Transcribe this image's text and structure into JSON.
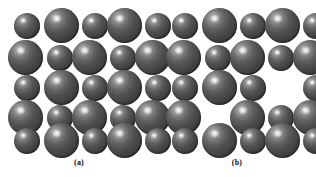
{
  "figure": {
    "background_color": "#ffffff",
    "sphere_color": "#4a4a4a",
    "sphere_highlight_color": "#d8d8d8",
    "sphere_edge_color": "#232323",
    "caption_color": "#111111"
  },
  "panels": [
    {
      "id": "a",
      "caption": "(a)",
      "description": "perfect ionic crystal lattice, 5 by 5 alternating large and small spheres",
      "rows": 5,
      "cols": 5,
      "spheres": [
        {
          "row": 1,
          "col": 1,
          "size": "small",
          "x": 14,
          "y": 13,
          "d": 26
        },
        {
          "row": 1,
          "col": 2,
          "size": "large",
          "x": 44,
          "y": 8,
          "d": 35
        },
        {
          "row": 1,
          "col": 3,
          "size": "small",
          "x": 82,
          "y": 13,
          "d": 26
        },
        {
          "row": 1,
          "col": 4,
          "size": "large",
          "x": 107,
          "y": 8,
          "d": 35
        },
        {
          "row": 1,
          "col": 5,
          "size": "small",
          "x": 145,
          "y": 13,
          "d": 26
        },
        {
          "row": 2,
          "col": 1,
          "size": "large",
          "x": 8,
          "y": 40,
          "d": 35
        },
        {
          "row": 2,
          "col": 2,
          "size": "small",
          "x": 47,
          "y": 45,
          "d": 26
        },
        {
          "row": 2,
          "col": 3,
          "size": "large",
          "x": 72,
          "y": 40,
          "d": 35
        },
        {
          "row": 2,
          "col": 4,
          "size": "small",
          "x": 110,
          "y": 45,
          "d": 26
        },
        {
          "row": 2,
          "col": 5,
          "size": "large",
          "x": 135,
          "y": 40,
          "d": 35
        },
        {
          "row": 3,
          "col": 1,
          "size": "small",
          "x": 14,
          "y": 75,
          "d": 26
        },
        {
          "row": 3,
          "col": 2,
          "size": "large",
          "x": 44,
          "y": 70,
          "d": 35
        },
        {
          "row": 3,
          "col": 3,
          "size": "small",
          "x": 82,
          "y": 75,
          "d": 26
        },
        {
          "row": 3,
          "col": 4,
          "size": "large",
          "x": 107,
          "y": 70,
          "d": 35
        },
        {
          "row": 3,
          "col": 5,
          "size": "small",
          "x": 145,
          "y": 75,
          "d": 26
        },
        {
          "row": 4,
          "col": 1,
          "size": "large",
          "x": 8,
          "y": 100,
          "d": 35
        },
        {
          "row": 4,
          "col": 2,
          "size": "small",
          "x": 47,
          "y": 105,
          "d": 26
        },
        {
          "row": 4,
          "col": 3,
          "size": "large",
          "x": 72,
          "y": 100,
          "d": 35
        },
        {
          "row": 4,
          "col": 4,
          "size": "small",
          "x": 110,
          "y": 105,
          "d": 26
        },
        {
          "row": 4,
          "col": 5,
          "size": "large",
          "x": 135,
          "y": 100,
          "d": 35
        },
        {
          "row": 5,
          "col": 1,
          "size": "small",
          "x": 14,
          "y": 128,
          "d": 26
        },
        {
          "row": 5,
          "col": 2,
          "size": "large",
          "x": 44,
          "y": 123,
          "d": 35
        },
        {
          "row": 5,
          "col": 3,
          "size": "small",
          "x": 82,
          "y": 128,
          "d": 26
        },
        {
          "row": 5,
          "col": 4,
          "size": "large",
          "x": 107,
          "y": 123,
          "d": 35
        },
        {
          "row": 5,
          "col": 5,
          "size": "small",
          "x": 145,
          "y": 128,
          "d": 26
        }
      ]
    },
    {
      "id": "b",
      "caption": "(b)",
      "description": "lattice with Schottky vacancy defects: one large sphere missing at row 3 column 4 and one small sphere missing at row 4 column 2",
      "rows": 5,
      "cols": 5,
      "vacancies": [
        {
          "row": 3,
          "col": 4,
          "size": "large"
        },
        {
          "row": 4,
          "col": 2,
          "size": "small"
        }
      ],
      "spheres": [
        {
          "row": 1,
          "col": 1,
          "size": "small",
          "x": 14,
          "y": 13,
          "d": 26
        },
        {
          "row": 1,
          "col": 2,
          "size": "large",
          "x": 44,
          "y": 8,
          "d": 35
        },
        {
          "row": 1,
          "col": 3,
          "size": "small",
          "x": 82,
          "y": 13,
          "d": 26
        },
        {
          "row": 1,
          "col": 4,
          "size": "large",
          "x": 107,
          "y": 8,
          "d": 35
        },
        {
          "row": 1,
          "col": 5,
          "size": "small",
          "x": 145,
          "y": 13,
          "d": 26
        },
        {
          "row": 2,
          "col": 1,
          "size": "large",
          "x": 8,
          "y": 40,
          "d": 35
        },
        {
          "row": 2,
          "col": 2,
          "size": "small",
          "x": 47,
          "y": 45,
          "d": 26
        },
        {
          "row": 2,
          "col": 3,
          "size": "large",
          "x": 72,
          "y": 40,
          "d": 35
        },
        {
          "row": 2,
          "col": 4,
          "size": "small",
          "x": 110,
          "y": 45,
          "d": 26
        },
        {
          "row": 2,
          "col": 5,
          "size": "large",
          "x": 135,
          "y": 40,
          "d": 35
        },
        {
          "row": 3,
          "col": 1,
          "size": "small",
          "x": 14,
          "y": 75,
          "d": 26
        },
        {
          "row": 3,
          "col": 2,
          "size": "large",
          "x": 44,
          "y": 70,
          "d": 35
        },
        {
          "row": 3,
          "col": 3,
          "size": "small",
          "x": 82,
          "y": 75,
          "d": 26
        },
        {
          "row": 3,
          "col": 5,
          "size": "small",
          "x": 145,
          "y": 75,
          "d": 26
        },
        {
          "row": 4,
          "col": 1,
          "size": "large",
          "x": 8,
          "y": 100,
          "d": 35
        },
        {
          "row": 4,
          "col": 3,
          "size": "large",
          "x": 72,
          "y": 100,
          "d": 35
        },
        {
          "row": 4,
          "col": 4,
          "size": "small",
          "x": 110,
          "y": 105,
          "d": 26
        },
        {
          "row": 4,
          "col": 5,
          "size": "large",
          "x": 135,
          "y": 100,
          "d": 35
        },
        {
          "row": 5,
          "col": 1,
          "size": "small",
          "x": 14,
          "y": 128,
          "d": 26
        },
        {
          "row": 5,
          "col": 2,
          "size": "large",
          "x": 44,
          "y": 123,
          "d": 35
        },
        {
          "row": 5,
          "col": 3,
          "size": "small",
          "x": 82,
          "y": 128,
          "d": 26
        },
        {
          "row": 5,
          "col": 4,
          "size": "large",
          "x": 107,
          "y": 123,
          "d": 35
        },
        {
          "row": 5,
          "col": 5,
          "size": "small",
          "x": 145,
          "y": 128,
          "d": 26
        }
      ]
    }
  ]
}
